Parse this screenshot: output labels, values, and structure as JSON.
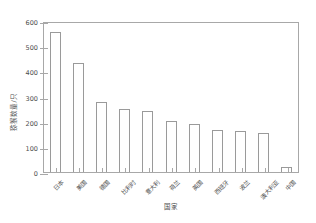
{
  "chart_data": {
    "type": "bar",
    "title": "",
    "xlabel": "国家",
    "ylabel": "猕猴数量/只",
    "categories": [
      "日本",
      "美国",
      "德国",
      "比利时",
      "意大利",
      "荷兰",
      "英国",
      "西班牙",
      "波兰",
      "澳大利亚",
      "中国"
    ],
    "values": [
      555,
      435,
      277,
      250,
      242,
      203,
      192,
      168,
      162,
      157,
      18
    ],
    "ylim": [
      0,
      600
    ],
    "yticks": [
      0,
      100,
      200,
      300,
      400,
      500,
      600
    ],
    "ytick_labels": [
      "0",
      "100",
      "200",
      "300",
      "400",
      "500",
      "600"
    ],
    "grid": false,
    "legend": false,
    "bar_face_color": "#ffffff",
    "bar_edge_color": "#9a9a9a",
    "axis_color": "#a8a8a8",
    "text_color": "#4d4d4d",
    "background_color": "#ffffff"
  }
}
